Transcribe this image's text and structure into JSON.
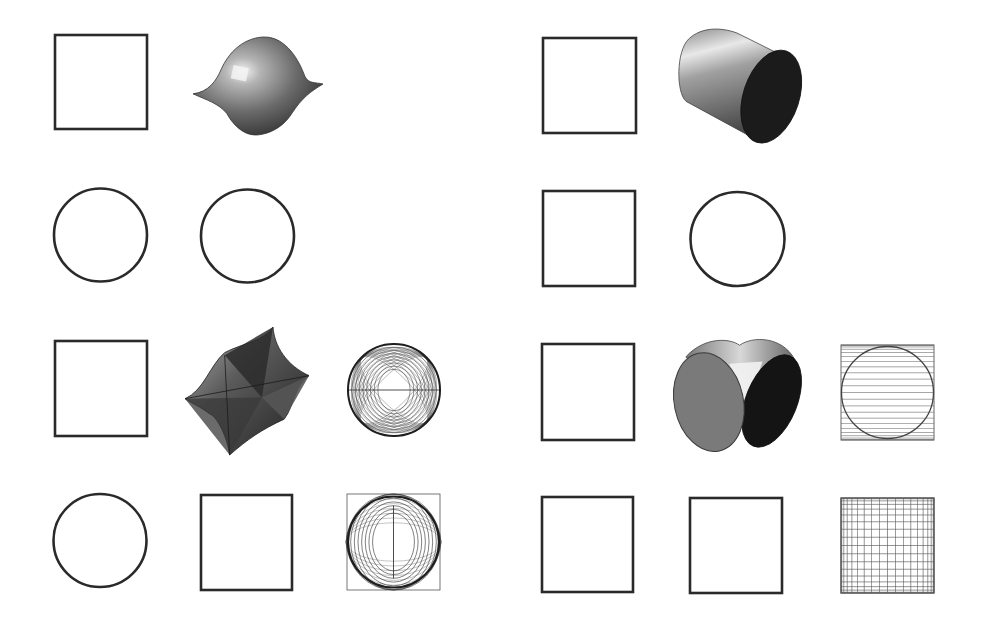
{
  "figure": {
    "width": 984,
    "height": 627,
    "background": "#ffffff",
    "stroke_color": "#2a2a2a",
    "panels": [
      {
        "id": "left",
        "rows": [
          {
            "row": 1,
            "items": [
              {
                "type": "square",
                "name": "projection-square",
                "x": 55,
                "y": 35,
                "w": 92,
                "h": 94
              },
              {
                "type": "solid-dome",
                "name": "dome-solid",
                "x": 193,
                "y": 37,
                "w": 130,
                "h": 98
              }
            ]
          },
          {
            "row": 2,
            "items": [
              {
                "type": "circle",
                "name": "projection-circle",
                "cx": 100.5,
                "cy": 235,
                "r": 46.5
              },
              {
                "type": "circle",
                "name": "projection-circle",
                "cx": 247.5,
                "cy": 236,
                "r": 46.5
              }
            ]
          },
          {
            "row": 3,
            "items": [
              {
                "type": "square",
                "name": "projection-square",
                "x": 55,
                "y": 341,
                "w": 92,
                "h": 95
              },
              {
                "type": "solid-star",
                "name": "star-solid",
                "x": 185,
                "y": 327,
                "w": 124,
                "h": 128
              },
              {
                "type": "wire-sphere",
                "name": "wireframe-sphere",
                "cx": 394,
                "cy": 390,
                "r": 46
              }
            ]
          },
          {
            "row": 4,
            "items": [
              {
                "type": "circle",
                "name": "projection-circle",
                "cx": 100,
                "cy": 540.5,
                "r": 46.5
              },
              {
                "type": "square",
                "name": "projection-square",
                "x": 201,
                "y": 495,
                "w": 91,
                "h": 95
              },
              {
                "type": "wire-square-rings",
                "name": "wireframe-square-rings",
                "x": 347,
                "y": 494,
                "w": 93,
                "h": 96
              }
            ]
          }
        ]
      },
      {
        "id": "right",
        "rows": [
          {
            "row": 1,
            "items": [
              {
                "type": "square",
                "name": "projection-square",
                "x": 543,
                "y": 38,
                "w": 93,
                "h": 95
              },
              {
                "type": "solid-cylinder",
                "name": "cylinder-solid",
                "x": 676,
                "y": 27,
                "w": 127,
                "h": 120
              }
            ]
          },
          {
            "row": 2,
            "items": [
              {
                "type": "square",
                "name": "projection-square",
                "x": 543,
                "y": 191,
                "w": 92,
                "h": 95
              },
              {
                "type": "circle",
                "name": "projection-circle",
                "cx": 737.5,
                "cy": 239,
                "r": 47
              }
            ]
          },
          {
            "row": 3,
            "items": [
              {
                "type": "square",
                "name": "projection-square",
                "x": 542,
                "y": 344,
                "w": 92,
                "h": 96
              },
              {
                "type": "solid-double-cylinder",
                "name": "double-cylinder-solid",
                "x": 673,
                "y": 336,
                "w": 128,
                "h": 116
              },
              {
                "type": "wire-box-circle",
                "name": "wireframe-box-circle",
                "x": 841,
                "y": 345,
                "w": 93,
                "h": 95
              }
            ]
          },
          {
            "row": 4,
            "items": [
              {
                "type": "square",
                "name": "projection-square",
                "x": 542,
                "y": 497,
                "w": 91,
                "h": 95
              },
              {
                "type": "square",
                "name": "projection-square",
                "x": 690,
                "y": 498,
                "w": 92,
                "h": 95
              },
              {
                "type": "wire-grid",
                "name": "wireframe-grid",
                "x": 841,
                "y": 498,
                "w": 93,
                "h": 95
              }
            ]
          }
        ]
      }
    ]
  }
}
